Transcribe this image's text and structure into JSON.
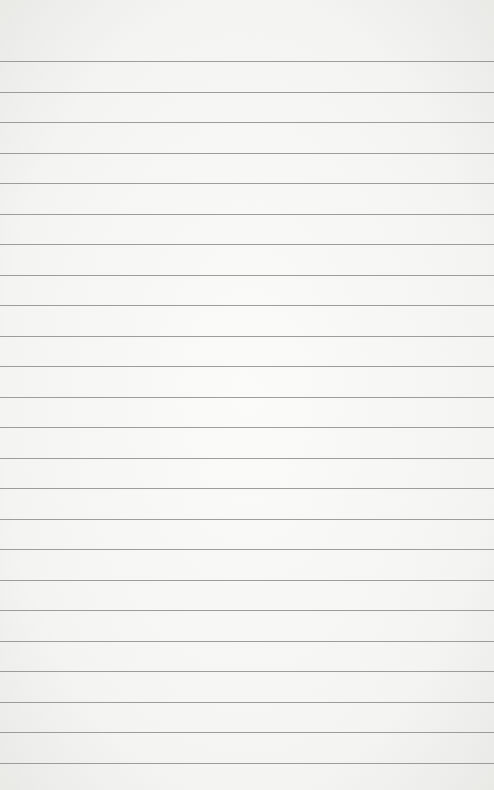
{
  "image": {
    "subject": "blank lined notebook paper",
    "paper_color": "#f6f6f4",
    "line_color": "#8d8d8b",
    "line_count": 24,
    "first_line_y": 61,
    "line_spacing": 30.52
  }
}
